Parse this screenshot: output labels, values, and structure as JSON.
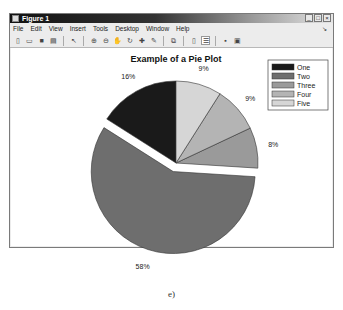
{
  "window": {
    "title": "Figure 1",
    "controls": {
      "minimize": "_",
      "maximize": "□",
      "close": "×"
    }
  },
  "menu": {
    "items": [
      "File",
      "Edit",
      "View",
      "Insert",
      "Tools",
      "Desktop",
      "Window",
      "Help"
    ],
    "dock_glyph": "↘"
  },
  "toolbar": {
    "buttons": [
      {
        "name": "new-figure",
        "glyph": "▯"
      },
      {
        "name": "open-file",
        "glyph": "▭"
      },
      {
        "name": "save-figure",
        "glyph": "■"
      },
      {
        "name": "print-figure",
        "glyph": "▤"
      },
      {
        "name": "edit-plot",
        "glyph": "↖"
      },
      {
        "name": "zoom-in",
        "glyph": "⊕"
      },
      {
        "name": "zoom-out",
        "glyph": "⊖"
      },
      {
        "name": "pan",
        "glyph": "✋"
      },
      {
        "name": "rotate-3d",
        "glyph": "↻"
      },
      {
        "name": "data-cursor",
        "glyph": "✚"
      },
      {
        "name": "brush",
        "glyph": "✎"
      },
      {
        "name": "link-plot",
        "glyph": "⧉"
      },
      {
        "name": "colorbar",
        "glyph": "▯"
      },
      {
        "name": "legend",
        "glyph": "☰"
      },
      {
        "name": "hide-plot-tools",
        "glyph": "▪"
      },
      {
        "name": "show-plot-tools",
        "glyph": "▣"
      }
    ]
  },
  "caption": "e)",
  "chart_data": {
    "type": "pie",
    "title": "Example of a Pie Plot",
    "categories": [
      "One",
      "Two",
      "Three",
      "Four",
      "Five"
    ],
    "values": [
      16,
      58,
      8,
      9,
      9
    ],
    "labels": [
      "16%",
      "58%",
      "8%",
      "9%",
      "9%"
    ],
    "colors": [
      "#1a1a1a",
      "#6e6e6e",
      "#9a9a9a",
      "#b4b4b4",
      "#d6d6d6"
    ],
    "exploded": [
      "Two"
    ],
    "legend": {
      "position": "northeast",
      "entries": [
        "One",
        "Two",
        "Three",
        "Four",
        "Five"
      ]
    },
    "start_angle_deg": 90,
    "direction": "counterclockwise"
  }
}
